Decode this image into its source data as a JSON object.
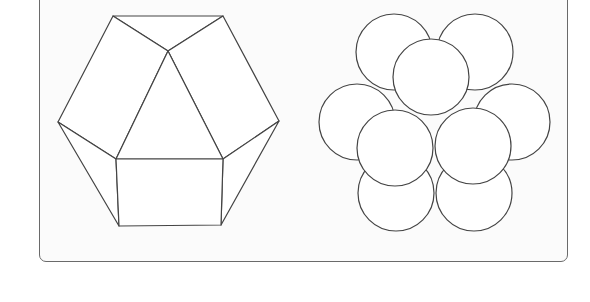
{
  "figure": {
    "stroke_color": "#444444",
    "fill_color": "#ffffff",
    "frame_color": "#6a6a6a"
  },
  "polyhedron": {
    "vertices": {
      "top_left": [
        113,
        16
      ],
      "top_right": [
        223,
        16
      ],
      "apex": [
        168,
        51
      ],
      "left": [
        58,
        122
      ],
      "right": [
        279,
        121
      ],
      "inner_bottom_left": [
        116,
        159
      ],
      "inner_bottom_right": [
        223,
        159
      ],
      "bottom_left": [
        119,
        226
      ],
      "bottom_right": [
        221,
        225
      ]
    }
  },
  "spheres": [
    {
      "cx": 357,
      "cy": 122,
      "r": 38
    },
    {
      "cx": 512,
      "cy": 122,
      "r": 38
    },
    {
      "cx": 396,
      "cy": 193,
      "r": 38
    },
    {
      "cx": 474,
      "cy": 193,
      "r": 38
    },
    {
      "cx": 394,
      "cy": 52,
      "r": 38
    },
    {
      "cx": 475,
      "cy": 52,
      "r": 38
    },
    {
      "cx": 431,
      "cy": 77,
      "r": 38
    },
    {
      "cx": 395,
      "cy": 148,
      "r": 38
    },
    {
      "cx": 473,
      "cy": 146,
      "r": 38
    }
  ]
}
